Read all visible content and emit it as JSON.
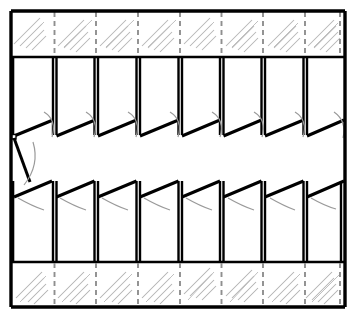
{
  "figure": {
    "type": "technical-line-drawing",
    "background_color": "#ffffff",
    "ink_color": "#000000",
    "hatch_color": "#a8a8a8",
    "dash_color": "#8c8c8c",
    "canvas": {
      "width": 357,
      "height": 317
    }
  },
  "geometry": {
    "outer_frame": {
      "left": 11,
      "right": 345,
      "top": 11,
      "bottom": 307,
      "stroke_width": 3.2
    },
    "bands": {
      "top_hatch_band": {
        "top": 11,
        "bottom": 57,
        "hatch_corner": "upper-right"
      },
      "upper_post_band": {
        "top": 57,
        "bottom": 131
      },
      "upper_sawtooth": {
        "peak_y": 120,
        "valley_y": 137
      },
      "open_gap_band": {
        "top": 137,
        "bottom": 182
      },
      "lower_sawtooth": {
        "peak_y": 180,
        "valley_y": 197
      },
      "lower_post_band": {
        "top": 182,
        "bottom": 262
      },
      "bottom_hatch_band": {
        "top": 262,
        "bottom": 307,
        "hatch_corner": "lower-left"
      }
    },
    "vertical_posts_x": [
      13,
      54.5,
      96,
      138,
      180,
      221.5,
      263,
      305
    ],
    "post_width": 4,
    "dashed_guide_offset": 5,
    "sawtooth": {
      "count": 8,
      "pitch": 41.7,
      "upper_direction": "rise-right",
      "lower_direction": "rise-right",
      "leader_arcs_per_tooth": 1
    },
    "left_edge_detail": {
      "description": "diagonal tie line from upper sawtooth valley down to lower sawtooth start",
      "from": [
        14,
        137
      ],
      "to": [
        30,
        180
      ]
    }
  },
  "labels": {
    "figure_caption": "",
    "reference_numerals": []
  }
}
